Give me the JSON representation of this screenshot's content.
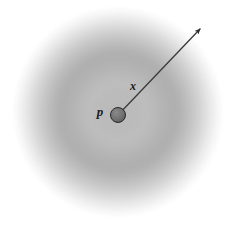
{
  "figure": {
    "kind": "radial-field-diagram",
    "width": 238,
    "height": 233,
    "background_color": "#ffffff"
  },
  "labels": {
    "point_label": "p",
    "vector_label": "x"
  },
  "point": {
    "name": "origin-point",
    "symbol": "p",
    "cx": 118,
    "cy": 115,
    "r": 7.5,
    "fill_color": "#6e6e6e",
    "stroke_color": "#2a2a2a"
  },
  "vector": {
    "name": "displacement-vector",
    "symbol": "x",
    "x1": 118,
    "y1": 115,
    "x2": 200,
    "y2": 29,
    "stroke_color": "#3a3a3a",
    "stroke_width": 1.3,
    "arrowhead": "filled-triangle"
  },
  "label_positions": {
    "p": {
      "x": 100,
      "y": 116
    },
    "x": {
      "x": 133,
      "y": 90
    }
  },
  "field": {
    "name": "radial-gradient-field",
    "center_x": 118,
    "center_y": 112,
    "outer_radius": 104,
    "clip_bottom_y": 219,
    "stops": [
      {
        "offset": 0.0,
        "color": "#b9b9b9"
      },
      {
        "offset": 0.3,
        "color": "#bdbdbd"
      },
      {
        "offset": 0.46,
        "color": "#b2b2b2"
      },
      {
        "offset": 0.56,
        "color": "#aeaeae"
      },
      {
        "offset": 0.66,
        "color": "#bcbcbc"
      },
      {
        "offset": 0.78,
        "color": "#d2d2d2"
      },
      {
        "offset": 0.88,
        "color": "#e8e8e8"
      },
      {
        "offset": 0.96,
        "color": "#f8f8f8"
      },
      {
        "offset": 1.0,
        "color": "#ffffff"
      }
    ]
  },
  "colors": {
    "ink": "#1a1a1a",
    "line": "#3a3a3a",
    "dot": "#6e6e6e",
    "field_dark": "#aeaeae",
    "field_light": "#ffffff"
  }
}
